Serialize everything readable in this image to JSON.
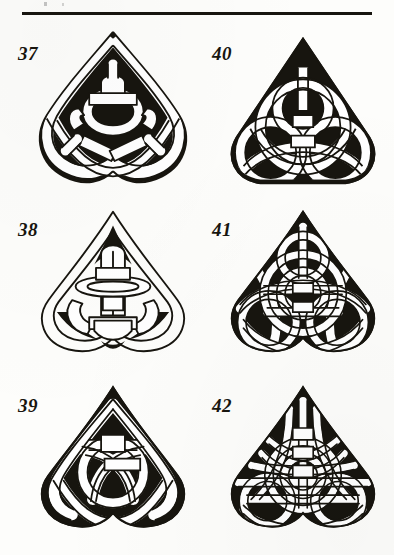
{
  "page": {
    "width": 394,
    "height": 555,
    "background_color": "#fdfdfb",
    "ink_color": "#17150f",
    "medium": "scanned book page, black ink line art"
  },
  "header_rule": {
    "name": "horizontal-rule",
    "x": 22,
    "y": 12,
    "width": 350,
    "height": 3,
    "color": "#17150f"
  },
  "figures": [
    {
      "label": "37",
      "name": "celtic-knot-37",
      "description": "Triquetra with three pointed lobes, heavy black fill in lobe interiors, woven ring center",
      "column": "left",
      "row": 1,
      "label_x": 18,
      "label_y": 44,
      "art_x": 28,
      "art_y": 26,
      "art_width": 170,
      "art_height": 180,
      "style": "pointed-lobe-filled",
      "fill": "solid-black-ground",
      "band_color": "#ffffff",
      "outline_color": "#17150f"
    },
    {
      "label": "40",
      "name": "celtic-knot-40",
      "description": "Sharp-apex triangular triquetra, black ground, dense white interlaced bands",
      "column": "right",
      "row": 1,
      "label_x": 212,
      "label_y": 44,
      "art_x": 218,
      "art_y": 26,
      "art_width": 170,
      "art_height": 180,
      "style": "triangular-dense",
      "fill": "solid-black-ground",
      "band_color": "#ffffff",
      "outline_color": "#17150f"
    },
    {
      "label": "38",
      "name": "celtic-knot-38",
      "description": "Open thin-line triquetra, small black accent slivers, looping open center weave",
      "column": "left",
      "row": 2,
      "label_x": 18,
      "label_y": 220,
      "art_x": 28,
      "art_y": 204,
      "art_width": 170,
      "art_height": 172,
      "style": "open-thin-line",
      "fill": "mostly-open",
      "band_color": "#ffffff",
      "outline_color": "#17150f"
    },
    {
      "label": "41",
      "name": "celtic-knot-41",
      "description": "Densely woven triquetra with many interlacing bands over black ground",
      "column": "right",
      "row": 2,
      "label_x": 212,
      "label_y": 220,
      "art_x": 218,
      "art_y": 204,
      "art_width": 170,
      "art_height": 172,
      "style": "woven-dense",
      "fill": "solid-black-ground",
      "band_color": "#ffffff",
      "outline_color": "#17150f"
    },
    {
      "label": "39",
      "name": "celtic-knot-39",
      "description": "Pointed-lobe triquetra with black filled regions and broad looping center bands",
      "column": "left",
      "row": 3,
      "label_x": 18,
      "label_y": 396,
      "art_x": 28,
      "art_y": 380,
      "art_width": 170,
      "art_height": 175,
      "style": "pointed-lobe-filled",
      "fill": "solid-black-ground",
      "band_color": "#ffffff",
      "outline_color": "#17150f"
    },
    {
      "label": "42",
      "name": "celtic-knot-42",
      "description": "Densest grid-like weave triquetra, square plaited center over black ground",
      "column": "right",
      "row": 3,
      "label_x": 212,
      "label_y": 396,
      "art_x": 218,
      "art_y": 380,
      "art_width": 170,
      "art_height": 175,
      "style": "grid-plait-dense",
      "fill": "solid-black-ground",
      "band_color": "#ffffff",
      "outline_color": "#17150f"
    }
  ]
}
